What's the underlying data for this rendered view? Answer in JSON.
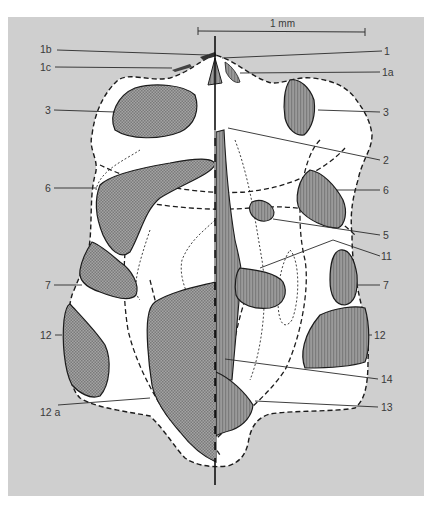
{
  "figure": {
    "type": "anatomical diagram (dorsal/ventral composite outline with numbered regions)",
    "background_color": "#cfcfcf",
    "outline_fill": "#ffffff",
    "left_region_pattern": "crosshatch stipple",
    "right_region_pattern": "vertical hatch",
    "region_fill": "#8e8e8e",
    "scale_bar": {
      "label": "1 mm"
    },
    "labels_left": [
      {
        "id": "1b",
        "text": "1b"
      },
      {
        "id": "1c",
        "text": "1c"
      },
      {
        "id": "3L",
        "text": "3"
      },
      {
        "id": "6L",
        "text": "6"
      },
      {
        "id": "7L",
        "text": "7"
      },
      {
        "id": "12L",
        "text": "12"
      },
      {
        "id": "12a",
        "text": "12 a"
      }
    ],
    "labels_right": [
      {
        "id": "1",
        "text": "1"
      },
      {
        "id": "1a",
        "text": "1a"
      },
      {
        "id": "3R",
        "text": "3"
      },
      {
        "id": "2",
        "text": "2"
      },
      {
        "id": "6R",
        "text": "6"
      },
      {
        "id": "5",
        "text": "5"
      },
      {
        "id": "11",
        "text": "11"
      },
      {
        "id": "7R",
        "text": "7"
      },
      {
        "id": "12R",
        "text": "12"
      },
      {
        "id": "14",
        "text": "14"
      },
      {
        "id": "13",
        "text": "13"
      }
    ]
  }
}
